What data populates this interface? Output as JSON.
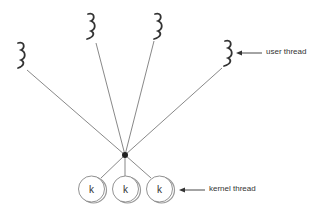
{
  "diagram": {
    "type": "many-to-one threading model",
    "labels": {
      "user_thread": "user thread",
      "kernel_thread": "kernel thread"
    },
    "user_threads": [
      {
        "id": "u1",
        "squiggle_x": 20,
        "squiggle_top": 42,
        "line_start": [
          27,
          70
        ]
      },
      {
        "id": "u2",
        "squiggle_x": 90,
        "squiggle_top": 13,
        "line_start": [
          96,
          43
        ]
      },
      {
        "id": "u3",
        "squiggle_x": 158,
        "squiggle_top": 13,
        "line_start": [
          154,
          41
        ]
      },
      {
        "id": "u4",
        "squiggle_x": 228,
        "squiggle_top": 40,
        "line_start": [
          222,
          68
        ]
      }
    ],
    "junction": [
      125,
      155
    ],
    "kernel_threads": [
      {
        "id": "k1",
        "label": "k",
        "cx": 92,
        "cy": 189
      },
      {
        "id": "k2",
        "label": "k",
        "cx": 126,
        "cy": 189
      },
      {
        "id": "k3",
        "label": "k",
        "cx": 160,
        "cy": 189
      }
    ],
    "colors": {
      "line": "#555555",
      "dot": "#222222",
      "circle_stroke": "#777777",
      "text": "#333333"
    }
  }
}
